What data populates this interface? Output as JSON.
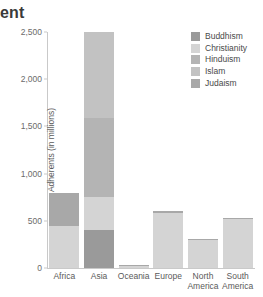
{
  "title": "ent",
  "axis": {
    "ylabel": "Adherents (in millions)",
    "yticks": [
      "0",
      "500",
      "1,000",
      "1,500",
      "2,000",
      "2,500"
    ]
  },
  "legend": {
    "items": [
      {
        "label": "Buddhism",
        "color": "#9a9a9a"
      },
      {
        "label": "Christianity",
        "color": "#d4d4d4"
      },
      {
        "label": "Hinduism",
        "color": "#b4b4b4"
      },
      {
        "label": "Islam",
        "color": "#c2c2c2"
      },
      {
        "label": "Judaism",
        "color": "#a8a8a8"
      }
    ]
  },
  "chart_data": {
    "type": "bar",
    "title": "ent",
    "xlabel": "",
    "ylabel": "Adherents (in millions)",
    "ylim": [
      0,
      2500
    ],
    "ytick_values": [
      0,
      500,
      1000,
      1500,
      2000,
      2500
    ],
    "grid": false,
    "stacked": true,
    "legend_position": "top-right",
    "categories": [
      "Africa",
      "Asia",
      "Oceania",
      "Europe",
      "North America",
      "South America"
    ],
    "series": [
      {
        "name": "Buddhism",
        "color": "#9a9a9a",
        "values": [
          0,
          400,
          0,
          0,
          0,
          0
        ]
      },
      {
        "name": "Christianity",
        "color": "#d4d4d4",
        "values": [
          440,
          355,
          26,
          580,
          305,
          530
        ]
      },
      {
        "name": "Hinduism",
        "color": "#b4b4b4",
        "values": [
          0,
          830,
          0,
          0,
          0,
          0
        ]
      },
      {
        "name": "Islam",
        "color": "#c2c2c2",
        "values": [
          0,
          915,
          0,
          0,
          0,
          0
        ]
      },
      {
        "name": "Judaism",
        "color": "#a8a8a8",
        "values": [
          355,
          0,
          4,
          20,
          5,
          5
        ]
      }
    ],
    "totals": [
      795,
      2500,
      30,
      600,
      310,
      535
    ]
  },
  "categories_display": [
    {
      "line1": "Africa",
      "line2": ""
    },
    {
      "line1": "Asia",
      "line2": ""
    },
    {
      "line1": "Oceania",
      "line2": ""
    },
    {
      "line1": "Europe",
      "line2": ""
    },
    {
      "line1": "North",
      "line2": "America"
    },
    {
      "line1": "South",
      "line2": "America"
    }
  ]
}
